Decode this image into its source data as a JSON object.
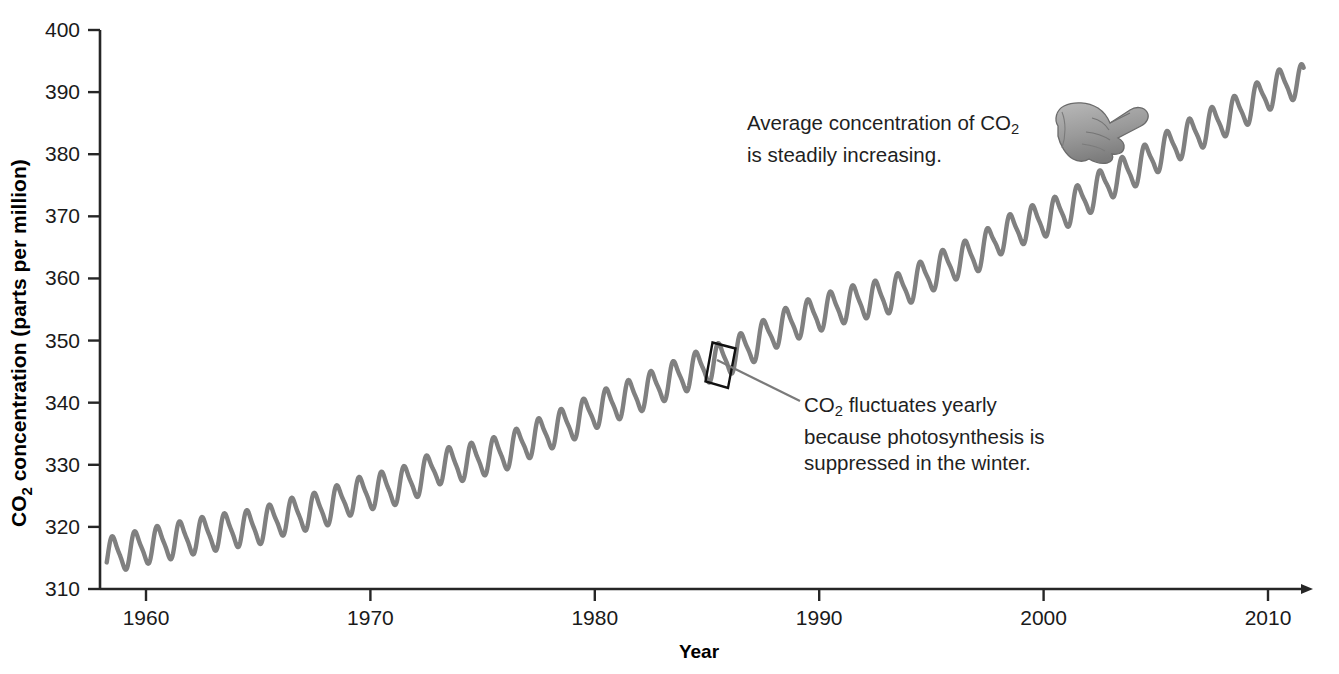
{
  "chart_data": {
    "type": "line",
    "title": "",
    "xlabel": "Year",
    "ylabel": "CO2 concentration (parts per million)",
    "ylabel_rich": {
      "prefix": "CO",
      "sub": "2",
      "suffix": " concentration (parts per million)"
    },
    "xlim": [
      1958,
      2012
    ],
    "ylim": [
      310,
      400
    ],
    "xticks": [
      1960,
      1970,
      1980,
      1990,
      2000,
      2010
    ],
    "xtick_labels": [
      "1960",
      "1970",
      "1980",
      "1990",
      "2000",
      "2010"
    ],
    "yticks": [
      310,
      320,
      330,
      340,
      350,
      360,
      370,
      380,
      390,
      400
    ],
    "ytick_labels": [
      "310",
      "320",
      "330",
      "340",
      "350",
      "360",
      "370",
      "380",
      "390",
      "400"
    ],
    "grid": false,
    "legend": "none",
    "series_color": "#808080",
    "axis_color": "#262626",
    "annual_amplitude_ppm": 3.0,
    "series": [
      {
        "name": "Atmospheric CO2 (annual mean trend)",
        "x": [
          1958,
          1959,
          1960,
          1961,
          1962,
          1963,
          1964,
          1965,
          1966,
          1967,
          1968,
          1969,
          1970,
          1971,
          1972,
          1973,
          1974,
          1975,
          1976,
          1977,
          1978,
          1979,
          1980,
          1981,
          1982,
          1983,
          1984,
          1985,
          1986,
          1987,
          1988,
          1989,
          1990,
          1991,
          1992,
          1993,
          1994,
          1995,
          1996,
          1997,
          1998,
          1999,
          2000,
          2001,
          2002,
          2003,
          2004,
          2005,
          2006,
          2007,
          2008,
          2009,
          2010,
          2011
        ],
        "values": [
          315.3,
          315.9,
          316.9,
          317.6,
          318.4,
          319.0,
          319.6,
          320.0,
          321.4,
          322.2,
          323.0,
          324.6,
          325.7,
          326.3,
          327.5,
          329.7,
          330.2,
          331.1,
          332.0,
          333.8,
          335.4,
          336.8,
          338.7,
          340.1,
          341.4,
          343.0,
          344.6,
          346.0,
          347.4,
          349.2,
          351.6,
          353.1,
          354.4,
          355.6,
          356.4,
          357.1,
          358.8,
          360.8,
          362.6,
          363.8,
          366.6,
          368.3,
          369.5,
          371.0,
          373.2,
          375.8,
          377.5,
          379.8,
          381.9,
          383.8,
          385.6,
          387.4,
          389.9,
          391.6
        ]
      }
    ]
  },
  "axis": {
    "y_label_prefix": "CO",
    "y_label_sub": "2",
    "y_label_suffix": " concentration (parts per million)",
    "x_label": "Year"
  },
  "annotations": [
    {
      "id": "average",
      "name": "annotation-average-increasing",
      "line1_prefix": "Average concentration of CO",
      "line1_sub": "2",
      "line2": "is steadily increasing."
    },
    {
      "id": "fluctuation",
      "name": "annotation-yearly-fluctuation",
      "line1_prefix": "CO",
      "line1_sub": "2",
      "line1_suffix": " fluctuates yearly",
      "line2": "because photosynthesis is",
      "line3": "suppressed in the winter."
    }
  ],
  "icons": {
    "pointing_hand": "pointing-hand-icon",
    "x_axis_arrow": "arrow-right-icon",
    "callout_box": "callout-box-icon",
    "leader_line": "leader-line-icon"
  },
  "colors": {
    "curve": "#808080",
    "axis": "#262626",
    "text": "#1a1a1a",
    "background": "#ffffff"
  }
}
